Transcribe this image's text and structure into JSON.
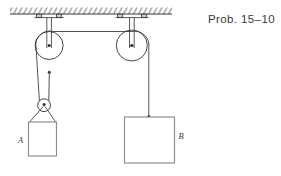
{
  "figure": {
    "caption": "Prob. 15–10",
    "labels": {
      "block_a": "A",
      "block_b": "B"
    },
    "colors": {
      "stroke": "#3b3b3b",
      "rope": "#4a4a4a",
      "block_outline": "#8c8c8c",
      "hatch": "#555555",
      "background": "#ffffff",
      "text": "#3a3a3a"
    },
    "elements": {
      "ceiling": "ceiling-support",
      "hatching": "hatch-marks",
      "left_bracket": "left-pulley-bracket",
      "right_bracket": "right-pulley-bracket",
      "left_pulley": "fixed-pulley-left",
      "right_pulley": "fixed-pulley-right",
      "movable_pulley": "movable-pulley",
      "rope": "rope",
      "block_a": "block-a",
      "block_b": "block-b",
      "sling": "sling-strap"
    }
  }
}
